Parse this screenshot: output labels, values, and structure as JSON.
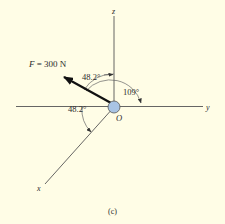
{
  "figure": {
    "caption": "(c)",
    "background": "#fffde6",
    "origin_label": "O",
    "origin_fill": "#a9c4e4",
    "axes": {
      "z_label": "z",
      "y_label": "y",
      "x_label": "x"
    },
    "force": {
      "symbol": "F",
      "equals": " = ",
      "value": "300 N",
      "full_label": "F = 300 N"
    },
    "angles": {
      "force_to_z": "48.2°",
      "x_to_neg_y": "48.2°",
      "force_to_y": "109°"
    }
  }
}
